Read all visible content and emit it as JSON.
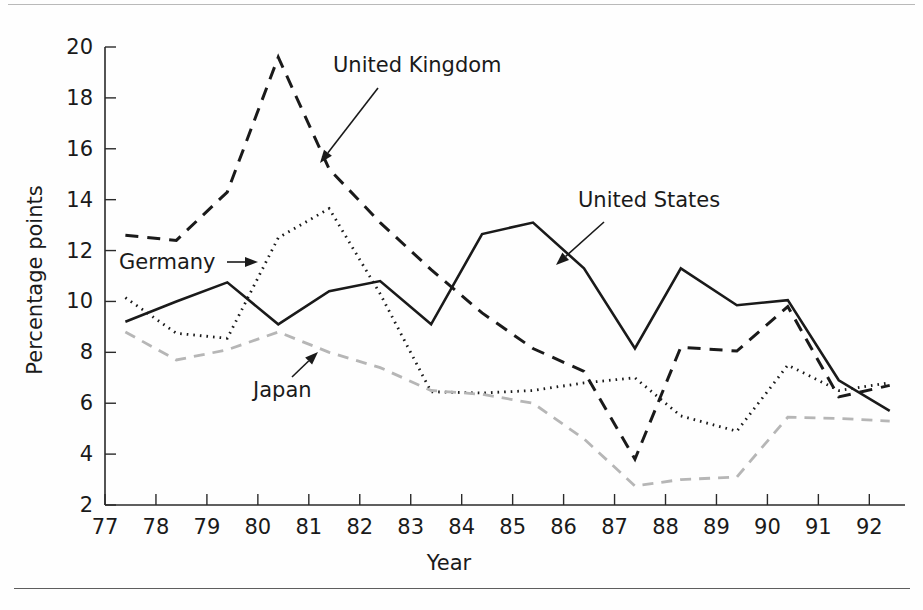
{
  "chart_data": {
    "type": "line",
    "title": "",
    "xlabel": "Year",
    "ylabel": "Percentage points",
    "xlim": [
      77.0,
      92.7
    ],
    "ylim": [
      2,
      20
    ],
    "grid": false,
    "legend_position": "inline-annotations",
    "x_tick_labels": [
      "77",
      "78",
      "79",
      "80",
      "81",
      "82",
      "83",
      "84",
      "85",
      "86",
      "87",
      "88",
      "89",
      "90",
      "91",
      "92"
    ],
    "x_ticks": [
      77,
      78,
      79,
      80,
      81,
      82,
      83,
      84,
      85,
      86,
      87,
      88,
      89,
      90,
      91,
      92
    ],
    "y_tick_labels": [
      "2",
      "4",
      "6",
      "8",
      "10",
      "12",
      "14",
      "16",
      "18",
      "20"
    ],
    "y_ticks": [
      2,
      4,
      6,
      8,
      10,
      12,
      14,
      16,
      18,
      20
    ],
    "x": [
      77.4,
      78.4,
      79.4,
      80.4,
      81.4,
      82.4,
      83.4,
      84.4,
      85.4,
      86.4,
      87.4,
      88.3,
      89.4,
      90.4,
      91.4,
      92.4
    ],
    "series": [
      {
        "name": "United States",
        "style": "solid",
        "color": "#1a1a1a",
        "values": [
          9.2,
          10.0,
          10.75,
          9.1,
          10.4,
          10.8,
          9.1,
          12.65,
          13.1,
          11.3,
          8.15,
          11.3,
          9.85,
          10.05,
          6.9,
          5.7
        ]
      },
      {
        "name": "United Kingdom",
        "style": "dashed",
        "color": "#1a1a1a",
        "values": [
          12.6,
          12.4,
          14.3,
          19.6,
          15.2,
          13.1,
          11.25,
          9.55,
          8.15,
          7.25,
          3.8,
          8.2,
          8.05,
          9.8,
          6.25,
          6.7
        ]
      },
      {
        "name": "Germany",
        "style": "dotted",
        "color": "#1a1a1a",
        "values": [
          10.15,
          8.75,
          8.55,
          12.5,
          13.65,
          10.3,
          6.45,
          6.4,
          6.5,
          6.8,
          7.0,
          5.5,
          4.9,
          7.5,
          6.5,
          6.8
        ]
      },
      {
        "name": "Japan",
        "style": "dashed-light",
        "color": "#b6b6b6",
        "values": [
          8.8,
          7.7,
          8.1,
          8.8,
          8.0,
          7.4,
          6.5,
          6.35,
          6.0,
          4.6,
          2.75,
          3.0,
          3.1,
          5.45,
          5.4,
          5.3
        ]
      }
    ],
    "annotations": [
      {
        "id": "annotation-united-kingdom",
        "text": "United Kingdom",
        "x": 333,
        "y": 72,
        "anchor": "start",
        "arrow_from": [
          378,
          88
        ],
        "arrow_to": [
          320,
          163
        ]
      },
      {
        "id": "annotation-united-states",
        "text": "United States",
        "x": 578,
        "y": 207,
        "anchor": "start",
        "arrow_from": [
          604,
          222
        ],
        "arrow_to": [
          556,
          265
        ]
      },
      {
        "id": "annotation-germany",
        "text": "Germany",
        "x": 119,
        "y": 269,
        "anchor": "start",
        "arrow_from": [
          227,
          262
        ],
        "arrow_to": [
          258,
          262
        ]
      },
      {
        "id": "annotation-japan",
        "text": "Japan",
        "x": 253,
        "y": 397,
        "anchor": "start",
        "arrow_from": [
          292,
          377
        ],
        "arrow_to": [
          318,
          352
        ]
      }
    ]
  }
}
